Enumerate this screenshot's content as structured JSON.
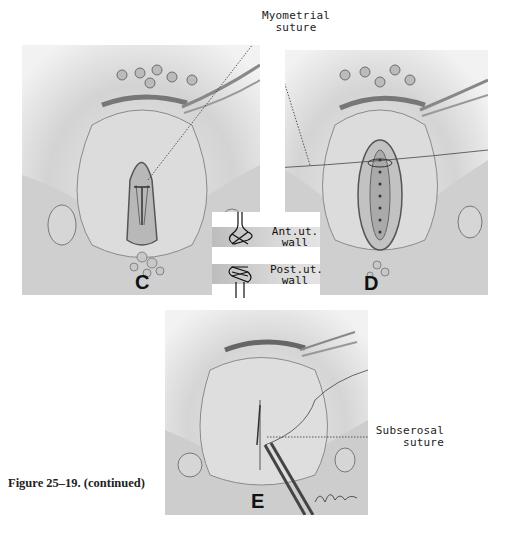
{
  "figure": {
    "caption": "Figure 25–19. (continued)",
    "panels": [
      {
        "id": "C",
        "label": "C"
      },
      {
        "id": "D",
        "label": "D"
      },
      {
        "id": "E",
        "label": "E"
      }
    ],
    "callouts": {
      "myometrial": {
        "line1": "Myometrial",
        "line2": "suture"
      },
      "subserosal": {
        "line1": "Subserosal",
        "line2": "suture"
      }
    },
    "inset": {
      "anterior": {
        "line1": "Ant.ut.",
        "line2": "wall"
      },
      "posterior": {
        "line1": "Post.ut.",
        "line2": "wall"
      }
    }
  }
}
